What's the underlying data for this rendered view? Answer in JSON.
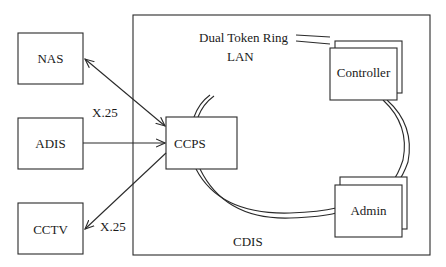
{
  "diagram": {
    "container": {
      "label": "CDIS"
    },
    "external_nodes": [
      {
        "id": "nas",
        "label": "NAS"
      },
      {
        "id": "adis",
        "label": "ADIS"
      },
      {
        "id": "cctv",
        "label": "CCTV"
      }
    ],
    "internal_nodes": [
      {
        "id": "ccps",
        "label": "CCPS"
      },
      {
        "id": "controller",
        "label": "Controller"
      },
      {
        "id": "admin",
        "label": "Admin"
      }
    ],
    "network": {
      "line1": "Dual Token Ring",
      "line2": "LAN"
    },
    "links": [
      {
        "from": "NAS",
        "to": "CCPS",
        "direction": "bidirectional",
        "label": "X.25"
      },
      {
        "from": "ADIS",
        "to": "CCPS",
        "direction": "one-way",
        "label": ""
      },
      {
        "from": "CCPS",
        "to": "CCTV",
        "direction": "one-way",
        "label": "X.25"
      }
    ],
    "edge_labels": {
      "nas_ccps": "X.25",
      "ccps_cctv": "X.25"
    }
  }
}
